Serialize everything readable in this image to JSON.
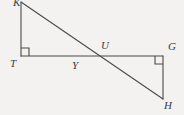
{
  "figure": {
    "width": 184,
    "height": 115,
    "background_color": "#f3f2f0",
    "stroke_color": "#4a4a4a",
    "label_color": "#3b3b3b",
    "stroke_width": 1.1,
    "points": {
      "K": {
        "label": "K",
        "x": 21,
        "y": 2,
        "note": "label clipped by top edge of image"
      },
      "T": {
        "label": "T",
        "x": 21,
        "y": 56
      },
      "Y": {
        "label": "Y",
        "x": 78,
        "y": 56
      },
      "U": {
        "label": "U",
        "x": 107,
        "y": 56
      },
      "G": {
        "label": "G",
        "x": 163,
        "y": 56
      },
      "H": {
        "label": "H",
        "x": 163,
        "y": 99
      }
    },
    "segments": [
      {
        "name": "segment-K-T",
        "from": "K",
        "to": "T",
        "x1": 21,
        "y1": 2,
        "x2": 21,
        "y2": 56
      },
      {
        "name": "segment-T-G",
        "from": "T",
        "to": "G",
        "x1": 21,
        "y1": 56,
        "x2": 163,
        "y2": 56
      },
      {
        "name": "segment-K-H",
        "from": "K",
        "to": "H",
        "x1": 21,
        "y1": 2,
        "x2": 163,
        "y2": 99
      },
      {
        "name": "segment-G-H",
        "from": "G",
        "to": "H",
        "x1": 163,
        "y1": 56,
        "x2": 163,
        "y2": 99
      }
    ],
    "right_angle_marks": [
      {
        "name": "right-angle-at-T",
        "vertex": "T",
        "x": 21,
        "y": 56,
        "size": 8,
        "dir_x": 1,
        "dir_y": -1
      },
      {
        "name": "right-angle-at-G",
        "vertex": "G",
        "x": 163,
        "y": 56,
        "size": 8,
        "dir_x": -1,
        "dir_y": 1
      }
    ],
    "label_positions": {
      "K": {
        "left": 13,
        "top": -3
      },
      "T": {
        "left": 10,
        "top": 58
      },
      "Y": {
        "left": 72,
        "top": 60
      },
      "U": {
        "left": 101,
        "top": 40
      },
      "G": {
        "left": 168,
        "top": 41
      },
      "H": {
        "left": 164,
        "top": 100
      }
    }
  }
}
